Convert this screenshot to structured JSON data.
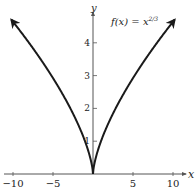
{
  "chart_data": {
    "type": "line",
    "function_label": "f(x) = x",
    "function_exponent": "2/3",
    "xlabel": "x",
    "ylabel": "y",
    "xlim": [
      -10.5,
      11
    ],
    "ylim": [
      0,
      5
    ],
    "x_ticks": [
      -10,
      -5,
      5,
      10
    ],
    "x_tick_labels": [
      "−10",
      "−5",
      "5",
      "10"
    ],
    "y_ticks": [
      1,
      2,
      3,
      4
    ],
    "y_tick_labels": [
      "1",
      "2",
      "3",
      "4"
    ],
    "grid": false,
    "legend": null,
    "series": [
      {
        "name": "f(x) = x^(2/3)",
        "x": [
          -10.2,
          -8,
          -6,
          -4,
          -2,
          -1,
          -0.5,
          0,
          0.5,
          1,
          2,
          4,
          6,
          8,
          10.2
        ],
        "values": [
          4.7,
          4.0,
          3.3,
          2.52,
          1.59,
          1.0,
          0.63,
          0,
          0.63,
          1.0,
          1.59,
          2.52,
          3.3,
          4.0,
          4.7
        ]
      }
    ],
    "annotations": [
      "arrowheads at both ends of curve",
      "arrowheads on positive x and y axes"
    ]
  },
  "colors": {
    "curve": "#1a1a1a",
    "axis": "#555555",
    "text": "#222222"
  }
}
